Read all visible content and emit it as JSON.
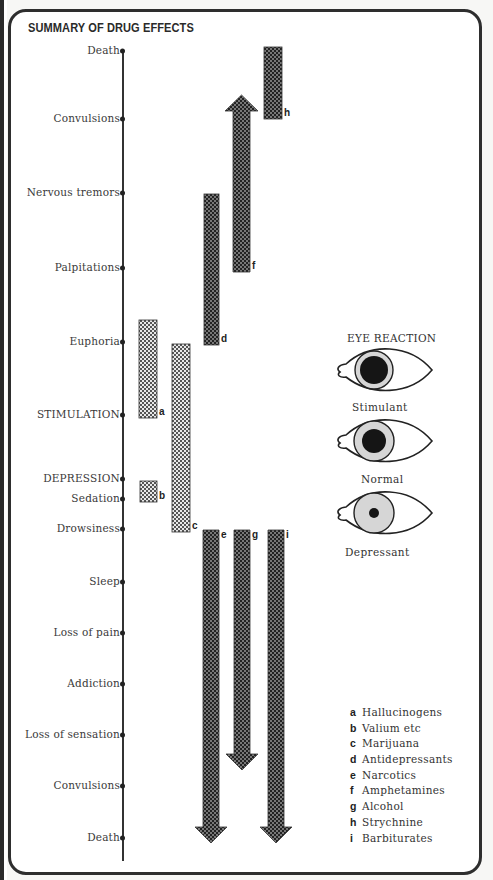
{
  "title": "SUMMARY OF DRUG EFFECTS",
  "axis": {
    "labels": [
      {
        "text": "Death",
        "y": 51
      },
      {
        "text": "Convulsions",
        "y": 119
      },
      {
        "text": "Nervous tremors",
        "y": 193
      },
      {
        "text": "Palpitations",
        "y": 268
      },
      {
        "text": "Euphoria",
        "y": 342
      },
      {
        "text": "STIMULATION",
        "y": 415
      },
      {
        "text": "DEPRESSION",
        "y": 479
      },
      {
        "text": "Sedation",
        "y": 499
      },
      {
        "text": "Drowsiness",
        "y": 529
      },
      {
        "text": "Sleep",
        "y": 582
      },
      {
        "text": "Loss of pain",
        "y": 633
      },
      {
        "text": "Addiction",
        "y": 684
      },
      {
        "text": "Loss of sensation",
        "y": 735
      },
      {
        "text": "Convulsions",
        "y": 786
      },
      {
        "text": "Death",
        "y": 838
      }
    ]
  },
  "bars": [
    {
      "key": "a",
      "type": "bar",
      "x": 139,
      "y1": 320,
      "y2": 418,
      "w": 18,
      "shade": "light"
    },
    {
      "key": "b",
      "type": "bar",
      "x": 140,
      "y1": 481,
      "y2": 502,
      "w": 17,
      "shade": "light"
    },
    {
      "key": "c",
      "type": "bar",
      "x": 172,
      "y1": 344,
      "y2": 532,
      "w": 18,
      "shade": "light"
    },
    {
      "key": "d",
      "type": "bar",
      "x": 204,
      "y1": 194,
      "y2": 345,
      "w": 15,
      "shade": "dark"
    },
    {
      "key": "e",
      "type": "arrow-down",
      "x": 203,
      "y1": 530,
      "y2": 843,
      "w": 16,
      "shade": "dark"
    },
    {
      "key": "f",
      "type": "arrow-up",
      "x": 233,
      "y1": 95,
      "y2": 272,
      "w": 17,
      "shade": "dark"
    },
    {
      "key": "g",
      "type": "arrow-down",
      "x": 234,
      "y1": 530,
      "y2": 770,
      "w": 16,
      "shade": "dark"
    },
    {
      "key": "h",
      "type": "bar",
      "x": 264,
      "y1": 47,
      "y2": 119,
      "w": 18,
      "shade": "dark"
    },
    {
      "key": "i",
      "type": "arrow-down",
      "x": 268,
      "y1": 530,
      "y2": 843,
      "w": 16,
      "shade": "dark"
    }
  ],
  "eye_reaction": {
    "title": "EYE REACTION",
    "eyes": [
      {
        "caption": "Stimulant",
        "cy": 370,
        "iris_r": 19,
        "pupil_r": 14,
        "caption_y": 401
      },
      {
        "caption": "Normal",
        "cy": 441,
        "iris_r": 20,
        "pupil_r": 12,
        "caption_y": 473
      },
      {
        "caption": "Depressant",
        "cy": 513,
        "iris_r": 20,
        "pupil_r": 5,
        "caption_y": 546
      }
    ]
  },
  "legend": [
    {
      "key": "a",
      "label": "Hallucinogens"
    },
    {
      "key": "b",
      "label": "Valium etc"
    },
    {
      "key": "c",
      "label": "Marijuana"
    },
    {
      "key": "d",
      "label": "Antidepressants"
    },
    {
      "key": "e",
      "label": "Narcotics"
    },
    {
      "key": "f",
      "label": "Amphetamines"
    },
    {
      "key": "g",
      "label": "Alcohol"
    },
    {
      "key": "h",
      "label": "Strychnine"
    },
    {
      "key": "i",
      "label": "Barbiturates"
    }
  ]
}
